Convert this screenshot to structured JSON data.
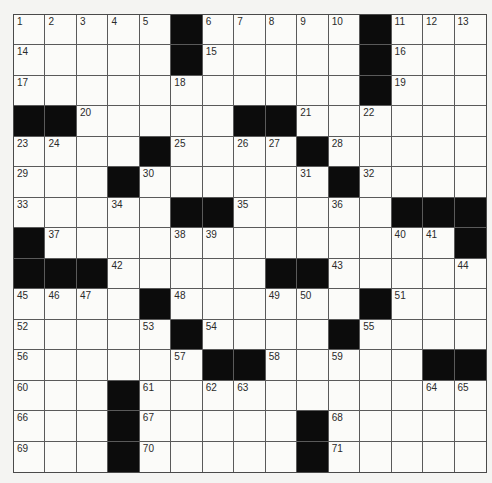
{
  "puzzle": {
    "size": {
      "rows": 15,
      "cols": 15
    },
    "colors": {
      "black": "#0c0c0c",
      "white": "#fbfbf9",
      "line": "#5a5a5a",
      "number": "#2a2a2a"
    },
    "rows": [
      [
        "1",
        "2",
        "3",
        "4",
        "5",
        "#",
        "6",
        "7",
        "8",
        "9",
        "10",
        "#",
        "11",
        "12",
        "13"
      ],
      [
        "14",
        "",
        "",
        "",
        "",
        "#",
        "15",
        "",
        "",
        "",
        "",
        "#",
        "16",
        "",
        ""
      ],
      [
        "17",
        "",
        "",
        "",
        "",
        "18",
        "",
        "",
        "",
        "",
        "",
        "#",
        "19",
        "",
        ""
      ],
      [
        "#",
        "#",
        "20",
        "",
        "",
        "",
        "",
        "#",
        "#",
        "21",
        "",
        "22",
        "",
        "",
        ""
      ],
      [
        "23",
        "24",
        "",
        "",
        "#",
        "25",
        "",
        "26",
        "27",
        "#",
        "28",
        "",
        "",
        "",
        ""
      ],
      [
        "29",
        "",
        "",
        "#",
        "30",
        "",
        "",
        "",
        "",
        "31",
        "#",
        "32",
        "",
        "",
        ""
      ],
      [
        "33",
        "",
        "",
        "34",
        "",
        "#",
        "#",
        "35",
        "",
        "",
        "36",
        "",
        "#",
        "#",
        "#"
      ],
      [
        "#",
        "37",
        "",
        "",
        "",
        "38",
        "39",
        "",
        "",
        "",
        "",
        "",
        "40",
        "41",
        "#"
      ],
      [
        "#",
        "#",
        "#",
        "42",
        "",
        "",
        "",
        "",
        "#",
        "#",
        "43",
        "",
        "",
        "",
        "44"
      ],
      [
        "45",
        "46",
        "47",
        "",
        "#",
        "48",
        "",
        "",
        "49",
        "50",
        "",
        "#",
        "51",
        "",
        ""
      ],
      [
        "52",
        "",
        "",
        "",
        "53",
        "#",
        "54",
        "",
        "",
        "",
        "#",
        "55",
        "",
        "",
        ""
      ],
      [
        "56",
        "",
        "",
        "",
        "",
        "57",
        "#",
        "#",
        "58",
        "",
        "59",
        "",
        "",
        "#",
        "#"
      ],
      [
        "60",
        "",
        "",
        "#",
        "61",
        "",
        "62",
        "63",
        "",
        "",
        "",
        "",
        "",
        "64",
        "65"
      ],
      [
        "66",
        "",
        "",
        "#",
        "67",
        "",
        "",
        "",
        "",
        "#",
        "68",
        "",
        "",
        "",
        ""
      ],
      [
        "69",
        "",
        "",
        "#",
        "70",
        "",
        "",
        "",
        "",
        "#",
        "71",
        "",
        "",
        "",
        ""
      ]
    ]
  }
}
